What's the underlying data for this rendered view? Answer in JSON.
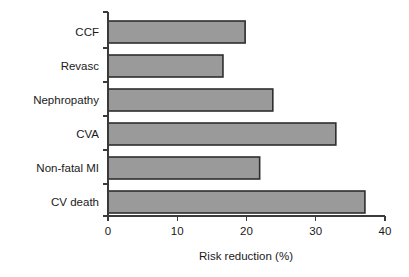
{
  "chart_data": {
    "type": "bar",
    "orientation": "horizontal",
    "title": "",
    "xlabel": "Risk reduction (%)",
    "ylabel": "",
    "categories": [
      "CCF",
      "Revasc",
      "Nephropathy",
      "CVA",
      "Non-fatal MI",
      "CV death"
    ],
    "values": [
      19.8,
      16.6,
      23.8,
      32.9,
      21.9,
      37.1
    ],
    "xlim": [
      0,
      40
    ],
    "xticks": [
      0,
      10,
      20,
      30,
      40
    ],
    "xtick_labels": [
      "0",
      "10",
      "20",
      "30",
      "40"
    ],
    "grid": false,
    "legend": false,
    "bar_fill_color": "#9a9a9a",
    "bar_edge_color": "#2e2e2e",
    "axis_color": "#3a3a3a",
    "background_color": "#ffffff"
  }
}
